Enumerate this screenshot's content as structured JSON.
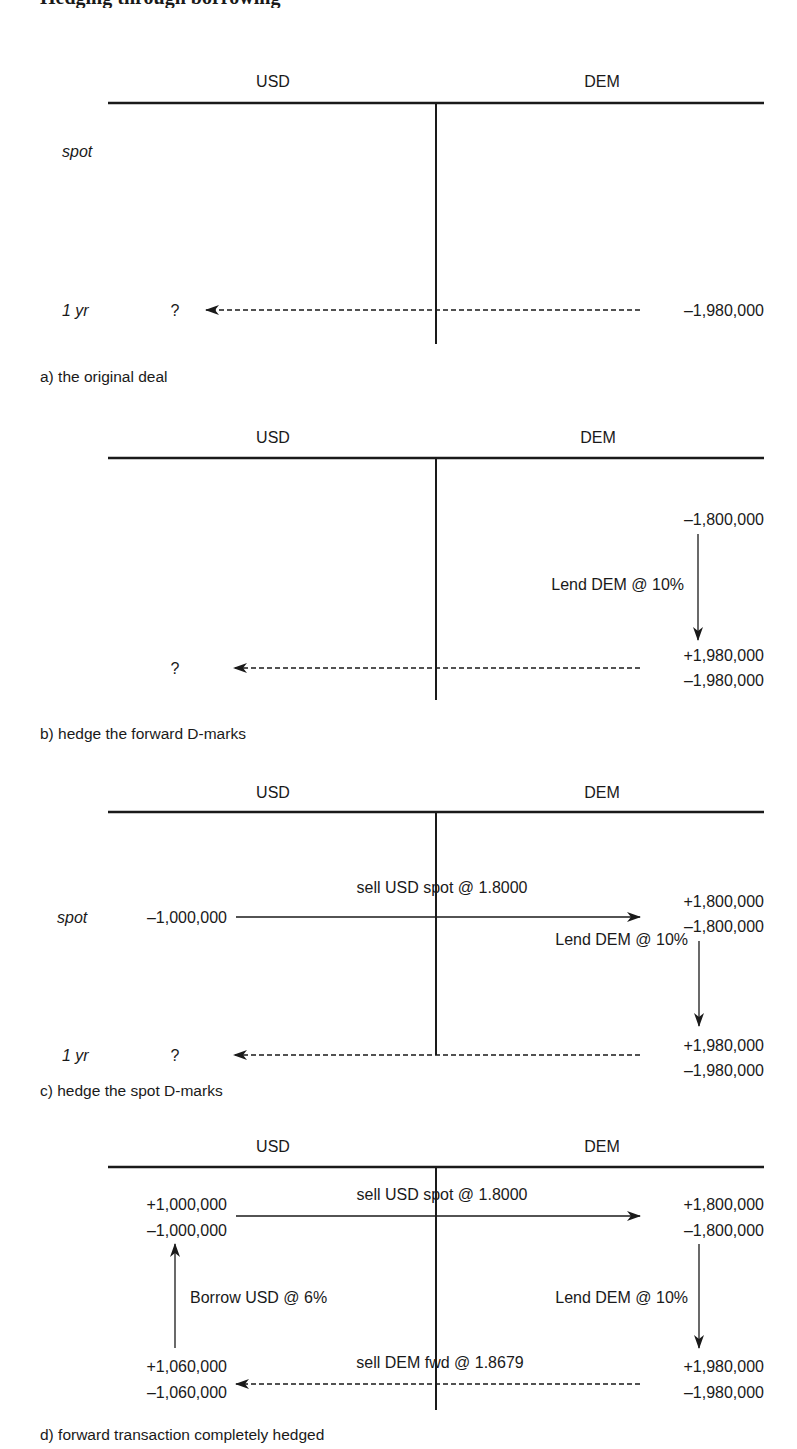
{
  "page": {
    "title_fragment": "Hedging through borrowing",
    "column_headers": {
      "usd": "USD",
      "dem": "DEM"
    },
    "row_labels": {
      "spot": "spot",
      "one_year": "1 yr"
    }
  },
  "panels": [
    {
      "id": "a",
      "caption": "a) the original deal",
      "usd_spot": [],
      "usd_1yr": [
        "?"
      ],
      "dem_spot": [],
      "dem_1yr": [
        "–1,980,000"
      ],
      "spot_arrow_label": "",
      "lend_label": "",
      "borrow_label": "",
      "fwd_arrow_label": ""
    },
    {
      "id": "b",
      "caption": "b) hedge the forward D-marks",
      "usd_spot": [],
      "usd_1yr": [
        "?"
      ],
      "dem_spot": [
        "–1,800,000"
      ],
      "dem_1yr": [
        "+1,980,000",
        "–1,980,000"
      ],
      "spot_arrow_label": "",
      "lend_label": "Lend DEM @ 10%",
      "borrow_label": "",
      "fwd_arrow_label": ""
    },
    {
      "id": "c",
      "caption": "c) hedge the spot D-marks",
      "usd_spot": [
        "–1,000,000"
      ],
      "usd_1yr": [
        "?"
      ],
      "dem_spot": [
        "+1,800,000",
        "–1,800,000"
      ],
      "dem_1yr": [
        "+1,980,000",
        "–1,980,000"
      ],
      "spot_arrow_label": "sell USD spot @ 1.8000",
      "lend_label": "Lend DEM @ 10%",
      "borrow_label": "",
      "fwd_arrow_label": ""
    },
    {
      "id": "d",
      "caption": "d) forward transaction completely hedged",
      "usd_spot": [
        "+1,000,000",
        "–1,000,000"
      ],
      "usd_1yr": [
        "+1,060,000",
        "–1,060,000"
      ],
      "dem_spot": [
        "+1,800,000",
        "–1,800,000"
      ],
      "dem_1yr": [
        "+1,980,000",
        "–1,980,000"
      ],
      "spot_arrow_label": "sell USD spot @ 1.8000",
      "lend_label": "Lend DEM @ 10%",
      "borrow_label": "Borrow USD @ 6%",
      "fwd_arrow_label": "sell DEM fwd @ 1.8679"
    }
  ],
  "colors": {
    "ink": "#1a1a1a",
    "background": "#ffffff"
  }
}
